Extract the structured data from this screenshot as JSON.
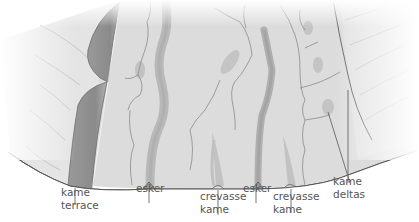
{
  "diagram": {
    "type": "glacial landforms cross-section illustration",
    "colors": {
      "ground": "#d9d9d9",
      "ground_light": "#e6e6e6",
      "ridge": "#b9b9b9",
      "terrace": "#8f8f8f",
      "line": "#555555",
      "text": "#555555"
    }
  },
  "labels": {
    "kame_terrace": {
      "line1": "kame",
      "line2": "terrace"
    },
    "esker_1": {
      "line1": "esker"
    },
    "crevasse_kame_1": {
      "line1": "crevasse",
      "line2": "kame"
    },
    "esker_2": {
      "line1": "esker"
    },
    "crevasse_kame_2": {
      "line1": "crevasse",
      "line2": "kame"
    },
    "kame_deltas": {
      "line1": "kame",
      "line2": "deltas"
    }
  }
}
